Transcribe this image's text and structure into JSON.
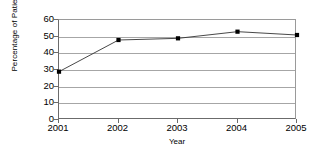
{
  "chart_data": {
    "type": "line",
    "title": "",
    "xlabel": "Year",
    "ylabel": "Percentage of Patients",
    "categories": [
      "2001",
      "2002",
      "2003",
      "2004",
      "2005"
    ],
    "x": [
      2001,
      2002,
      2003,
      2004,
      2005
    ],
    "values": [
      29,
      48,
      49,
      53,
      51
    ],
    "series": [
      {
        "name": "Percentage of Patients",
        "values": [
          29,
          48,
          49,
          53,
          51
        ],
        "color": "#333333",
        "marker": "square",
        "marker_color": "#000000"
      }
    ],
    "ylim": [
      0,
      60
    ],
    "yticks": [
      0,
      10,
      20,
      30,
      40,
      50,
      60
    ],
    "ytick_labels": [
      "0",
      "10",
      "20",
      "30",
      "40",
      "50",
      "60"
    ],
    "xtick_labels": [
      "2001",
      "2002",
      "2003",
      "2004",
      "2005"
    ],
    "grid": "horizontal",
    "legend": "none",
    "background": "#ffffff",
    "axis_color": "#6b6b6b",
    "gridline_color": "#a6a6a6"
  }
}
